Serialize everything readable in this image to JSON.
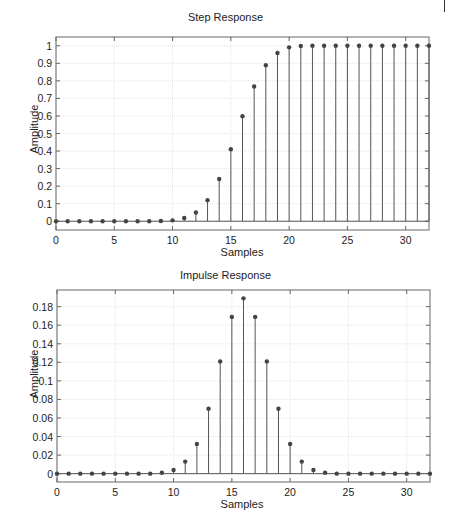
{
  "page": {
    "marker": "|"
  },
  "chart_data": [
    {
      "type": "stem",
      "title": "Step Response",
      "xlabel": "Samples",
      "ylabel": "Amplitude",
      "xlim": [
        0,
        32
      ],
      "ylim": [
        -0.05,
        1.05
      ],
      "xticks": [
        0,
        5,
        10,
        15,
        20,
        25,
        30
      ],
      "xtick_labels": [
        "0",
        "5",
        "10",
        "15",
        "20",
        "25",
        "30"
      ],
      "yticks": [
        0,
        0.1,
        0.2,
        0.3,
        0.4,
        0.5,
        0.6,
        0.7,
        0.8,
        0.9,
        1
      ],
      "ytick_labels": [
        "0",
        "0.1",
        "0.2",
        "0.3",
        "0.4",
        "0.5",
        "0.6",
        "0.7",
        "0.8",
        "0.9",
        "1"
      ],
      "grid": true,
      "x": [
        0,
        1,
        2,
        3,
        4,
        5,
        6,
        7,
        8,
        9,
        10,
        11,
        12,
        13,
        14,
        15,
        16,
        17,
        18,
        19,
        20,
        21,
        22,
        23,
        24,
        25,
        26,
        27,
        28,
        29,
        30,
        31,
        32
      ],
      "values": [
        0,
        0,
        0,
        0,
        0,
        0,
        0,
        0,
        0,
        0.001,
        0.005,
        0.018,
        0.05,
        0.12,
        0.241,
        0.41,
        0.599,
        0.768,
        0.889,
        0.959,
        0.991,
        0.999,
        1,
        1,
        1,
        1,
        1,
        1,
        1,
        1,
        1,
        1,
        1
      ]
    },
    {
      "type": "stem",
      "title": "Impulse Response",
      "xlabel": "Samples",
      "ylabel": "Amplitude",
      "xlim": [
        0,
        32
      ],
      "ylim": [
        -0.009,
        0.198
      ],
      "xticks": [
        0,
        5,
        10,
        15,
        20,
        25,
        30
      ],
      "xtick_labels": [
        "0",
        "5",
        "10",
        "15",
        "20",
        "25",
        "30"
      ],
      "yticks": [
        0,
        0.02,
        0.04,
        0.06,
        0.08,
        0.1,
        0.12,
        0.14,
        0.16,
        0.18
      ],
      "ytick_labels": [
        "0",
        "0.02",
        "0.04",
        "0.06",
        "0.08",
        "0.1",
        "0.12",
        "0.14",
        "0.16",
        "0.18"
      ],
      "grid": true,
      "x": [
        0,
        1,
        2,
        3,
        4,
        5,
        6,
        7,
        8,
        9,
        10,
        11,
        12,
        13,
        14,
        15,
        16,
        17,
        18,
        19,
        20,
        21,
        22,
        23,
        24,
        25,
        26,
        27,
        28,
        29,
        30,
        31,
        32
      ],
      "values": [
        0,
        0,
        0,
        0,
        0,
        0,
        0,
        0,
        0,
        0.001,
        0.004,
        0.013,
        0.032,
        0.07,
        0.121,
        0.169,
        0.189,
        0.169,
        0.121,
        0.07,
        0.032,
        0.013,
        0.004,
        0.001,
        0,
        0,
        0,
        0,
        0,
        0,
        0,
        0,
        0
      ]
    }
  ],
  "style": {
    "stem_color": "#555555",
    "marker_color": "#444444",
    "grid_color": "#dcdcdc",
    "axis_color": "#666666"
  }
}
